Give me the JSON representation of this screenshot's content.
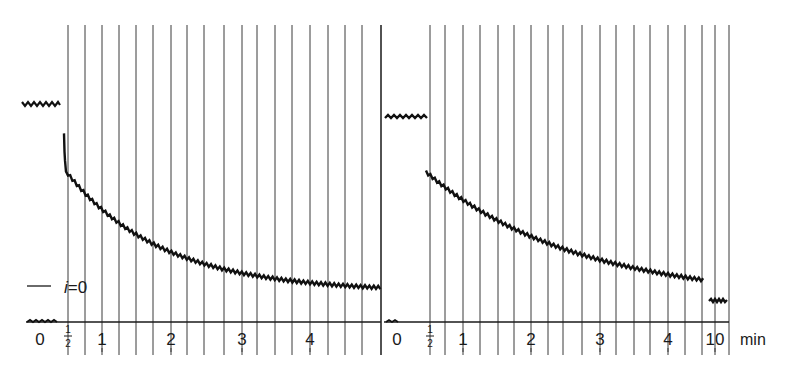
{
  "chart_data": [
    {
      "type": "line",
      "panel": "left",
      "title": "",
      "xlabel": "",
      "ylabel": "",
      "x_unit": "min",
      "tick_labels": [
        "0",
        "1/2",
        "1",
        "2",
        "3",
        "4"
      ],
      "annotations": [
        "— i = 0"
      ],
      "baseline_before_start": {
        "x": [
          -0.5,
          0
        ],
        "level": "i = 0 baseline (axis)"
      },
      "pre_step_level": {
        "x": [
          -0.6,
          -0.05
        ],
        "relative_height": 0.76
      },
      "series": [
        {
          "name": "current decay",
          "x": [
            0.5,
            0.55,
            0.75,
            1.0,
            1.5,
            2.0,
            2.5,
            3.0,
            3.5,
            4.0,
            4.5,
            4.95
          ],
          "y": [
            0.62,
            0.52,
            0.44,
            0.38,
            0.31,
            0.25,
            0.21,
            0.18,
            0.16,
            0.14,
            0.12,
            0.11
          ]
        }
      ],
      "grid": "vertical lines every ~1/4 min",
      "xlim": [
        -0.5,
        5.0
      ]
    },
    {
      "type": "line",
      "panel": "right",
      "title": "",
      "xlabel": "min",
      "ylabel": "",
      "x_unit": "min",
      "tick_labels": [
        "0",
        "1/2",
        "1",
        "2",
        "3",
        "4",
        "10"
      ],
      "baseline_before_start": {
        "x": [
          -0.05,
          0.05
        ],
        "level": "axis"
      },
      "pre_step_level": {
        "x": [
          -0.05,
          0.2
        ],
        "relative_height": 0.73
      },
      "series": [
        {
          "name": "current decay",
          "x": [
            0.5,
            0.75,
            1.0,
            1.5,
            2.0,
            2.5,
            3.0,
            3.5,
            4.0,
            4.5
          ],
          "y": [
            0.53,
            0.46,
            0.41,
            0.33,
            0.27,
            0.23,
            0.19,
            0.17,
            0.15,
            0.13
          ]
        },
        {
          "name": "value at 10 min",
          "x": [
            10
          ],
          "y": [
            0.07
          ]
        }
      ],
      "grid": "vertical lines every ~1/4 min",
      "xlim": [
        0,
        10
      ]
    }
  ],
  "annotation": {
    "legend_dash": "—",
    "i_label": "i",
    "eq_label": "=0"
  },
  "left_axis": {
    "ticks": [
      {
        "label": "0",
        "x": 40
      },
      {
        "label": "½",
        "x": 68
      },
      {
        "label": "1",
        "x": 102
      },
      {
        "label": "2",
        "x": 171
      },
      {
        "label": "3",
        "x": 242
      },
      {
        "label": "4",
        "x": 310
      }
    ]
  },
  "right_axis": {
    "ticks": [
      {
        "label": "0",
        "x": 397
      },
      {
        "label": "½",
        "x": 430
      },
      {
        "label": "1",
        "x": 463
      },
      {
        "label": "2",
        "x": 531
      },
      {
        "label": "3",
        "x": 600
      },
      {
        "label": "4",
        "x": 668
      },
      {
        "label": "10",
        "x": 715
      }
    ],
    "unit_label": "min"
  },
  "grid_lines": {
    "left": [
      68,
      85,
      102,
      119,
      136,
      153,
      171,
      187,
      204,
      224,
      242,
      257,
      275,
      292,
      310,
      328,
      345,
      362,
      381
    ],
    "right": [
      430,
      445,
      463,
      480,
      498,
      514,
      531,
      548,
      563,
      582,
      600,
      616,
      634,
      650,
      668,
      685,
      702,
      715,
      729
    ]
  },
  "colors": {
    "ink": "#1a1a1a",
    "grid": "#3a3a3a",
    "background": "#ffffff"
  }
}
